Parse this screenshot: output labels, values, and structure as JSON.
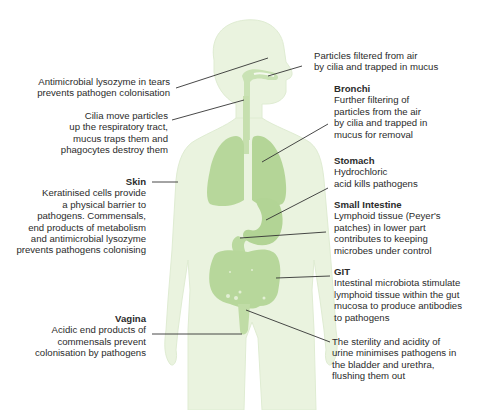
{
  "diagram": {
    "colors": {
      "body_fill": "#eaf3df",
      "body_edge": "#dcebcd",
      "organ_fill": "#b7d79b",
      "organ_dark": "#a6cc86",
      "leader_line": "#333333",
      "text": "#2b2b2b"
    },
    "labels": [
      {
        "id": "eyes",
        "side": "left",
        "title": "",
        "body": "Antimicrobial lysozyme in tears\nprevents pathogen colonisation"
      },
      {
        "id": "respiratory",
        "side": "left",
        "title": "",
        "body": "Cilia move particles\nup the respiratory tract,\nmucus traps them and\nphagocytes destroy them"
      },
      {
        "id": "skin",
        "side": "left",
        "title": "Skin",
        "body": "Keratinised cells provide\na physical barrier to\npathogens. Commensals,\nend products of metabolism\nand antimicrobial lysozyme\nprevents pathogens colonising"
      },
      {
        "id": "vagina",
        "side": "left",
        "title": "Vagina",
        "body": "Acidic end products of\ncommensals prevent\ncolonisation by pathogens"
      },
      {
        "id": "nose",
        "side": "right",
        "title": "",
        "body": "Particles filtered from air\nby cilia and trapped in mucus"
      },
      {
        "id": "bronchi",
        "side": "right",
        "title": "Bronchi",
        "body": "Further filtering of\nparticles from the air\nby cilia and trapped in\nmucus for removal"
      },
      {
        "id": "stomach",
        "side": "right",
        "title": "Stomach",
        "body": "Hydrochloric\nacid kills pathogens"
      },
      {
        "id": "small_intestine",
        "side": "right",
        "title": "Small Intestine",
        "body": "Lymphoid tissue (Peyer's\npatches) in lower part\ncontributes to keeping\nmicrobes under control"
      },
      {
        "id": "git",
        "side": "right",
        "title": "GIT",
        "body": "Intestinal microbiota stimulate\nlymphoid tissue within the gut\nmucosa to produce antibodies\nto pathogens"
      },
      {
        "id": "urinary",
        "side": "right",
        "title": "",
        "body": "The sterility and acidity of\nurine minimises pathogens in\nthe bladder and urethra,\nflushing them out"
      }
    ]
  }
}
